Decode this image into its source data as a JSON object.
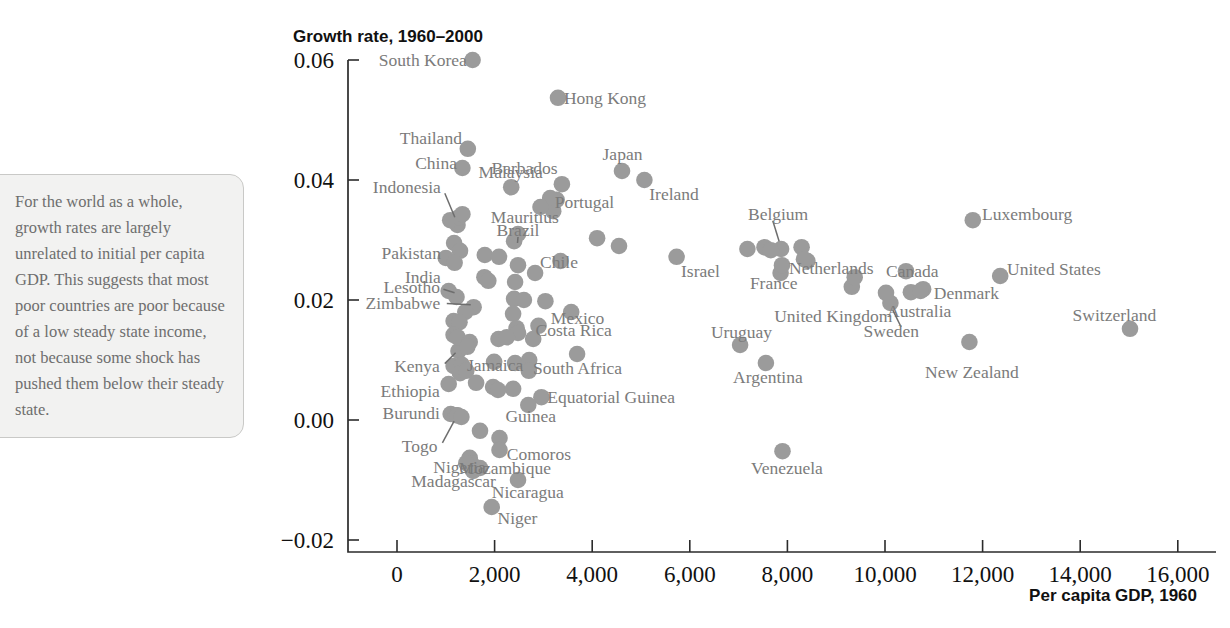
{
  "annotation": {
    "text": "For the world as a whole, growth rates are largely unrelated to initial per capita GDP. This suggests that most poor countries are poor because of a low steady state income, not because some shock has pushed them below their steady state."
  },
  "chart_data": {
    "type": "scatter",
    "title": "Growth rate, 1960–2000",
    "xlabel": "Per capita GDP, 1960",
    "ylabel": "Growth rate, 1960–2000",
    "xlim": [
      -800,
      16400
    ],
    "ylim": [
      -0.02,
      0.06
    ],
    "grid": false,
    "legend": null,
    "xticks": [
      0,
      2000,
      4000,
      6000,
      8000,
      10000,
      12000,
      14000,
      16000
    ],
    "xticklabels": [
      "0",
      "2,000",
      "4,000",
      "6,000",
      "8,000",
      "10,000",
      "12,000",
      "14,000",
      "16,000"
    ],
    "yticks": [
      -0.02,
      0.0,
      0.02,
      0.04,
      0.06
    ],
    "yticklabels": [
      "−0.02",
      "0.00",
      "0.02",
      "0.04",
      "0.06"
    ],
    "marker_color": "#9b9b9b",
    "points": [
      {
        "name": "South Korea",
        "x": 1550,
        "y": 0.06,
        "lx": 1430,
        "ly": 0.06,
        "anchor": "end"
      },
      {
        "name": "Hong Kong",
        "x": 3300,
        "y": 0.0537,
        "lx": 3420,
        "ly": 0.0537,
        "anchor": "start"
      },
      {
        "name": "Thailand",
        "x": 1450,
        "y": 0.0452,
        "lx": 1330,
        "ly": 0.047,
        "anchor": "end"
      },
      {
        "name": "China",
        "x": 1340,
        "y": 0.042,
        "lx": 1230,
        "ly": 0.0428,
        "anchor": "end"
      },
      {
        "name": "Malaysia",
        "x": 2340,
        "y": 0.0388,
        "lx": 2330,
        "ly": 0.0413,
        "anchor": "mid"
      },
      {
        "name": "Barbados",
        "x": 3380,
        "y": 0.0393,
        "lx": 3290,
        "ly": 0.042,
        "anchor": "end"
      },
      {
        "name": "Japan",
        "x": 4610,
        "y": 0.0415,
        "lx": 4620,
        "ly": 0.0443,
        "anchor": "mid"
      },
      {
        "name": "Ireland",
        "x": 5070,
        "y": 0.04,
        "lx": 5170,
        "ly": 0.0377,
        "anchor": "start"
      },
      {
        "name": "Indonesia",
        "x": 1240,
        "y": 0.0325,
        "lx": 900,
        "ly": 0.0388,
        "anchor": "end",
        "leader": [
          1185,
          0.0338,
          980,
          0.0378
        ]
      },
      {
        "name": "Portugal",
        "x": 3270,
        "y": 0.0367,
        "lx": 3840,
        "ly": 0.0363,
        "anchor": "mid"
      },
      {
        "name": "Mauritius",
        "x": 3200,
        "y": 0.0348,
        "lx": 2620,
        "ly": 0.0338,
        "anchor": "mid"
      },
      {
        "name": "Brazil",
        "x": 2480,
        "y": 0.031,
        "lx": 2480,
        "ly": 0.0317,
        "anchor": "mid",
        "leader": [
          2470,
          0.0295,
          2480,
          0.0305
        ]
      },
      {
        "name": "Belgium",
        "x": 7870,
        "y": 0.0285,
        "lx": 7810,
        "ly": 0.0343,
        "anchor": "mid",
        "leader": [
          7830,
          0.0298,
          7700,
          0.0332
        ]
      },
      {
        "name": "Luxembourg",
        "x": 11800,
        "y": 0.0333,
        "lx": 11990,
        "ly": 0.0343,
        "anchor": "start"
      },
      {
        "name": "Pakistan",
        "x": 1000,
        "y": 0.027,
        "lx": 900,
        "ly": 0.0278,
        "anchor": "end"
      },
      {
        "name": "Chile",
        "x": 3350,
        "y": 0.0265,
        "lx": 3320,
        "ly": 0.0263,
        "anchor": "mid"
      },
      {
        "name": "Israel",
        "x": 5730,
        "y": 0.0272,
        "lx": 5820,
        "ly": 0.0249,
        "anchor": "start"
      },
      {
        "name": "Netherlands",
        "x": 8410,
        "y": 0.0265,
        "lx": 8900,
        "ly": 0.0253,
        "anchor": "mid"
      },
      {
        "name": "Canada",
        "x": 10430,
        "y": 0.0248,
        "lx": 10560,
        "ly": 0.0248,
        "anchor": "mid"
      },
      {
        "name": "United States",
        "x": 12360,
        "y": 0.024,
        "lx": 12500,
        "ly": 0.0252,
        "anchor": "start"
      },
      {
        "name": "India",
        "x": 1060,
        "y": 0.0215,
        "lx": 900,
        "ly": 0.0238,
        "anchor": "end"
      },
      {
        "name": "France",
        "x": 7860,
        "y": 0.0245,
        "lx": 7720,
        "ly": 0.0228,
        "anchor": "mid"
      },
      {
        "name": "Lesotho",
        "x": 1220,
        "y": 0.0205,
        "lx": 880,
        "ly": 0.0222,
        "anchor": "end",
        "leader": [
          1180,
          0.0212,
          950,
          0.0218
        ]
      },
      {
        "name": "Denmark",
        "x": 10780,
        "y": 0.0218,
        "lx": 11000,
        "ly": 0.0211,
        "anchor": "start"
      },
      {
        "name": "Zimbabwe",
        "x": 1570,
        "y": 0.0188,
        "lx": 890,
        "ly": 0.0195,
        "anchor": "end",
        "leader": [
          1510,
          0.0192,
          1020,
          0.0194
        ]
      },
      {
        "name": "Mexico",
        "x": 3570,
        "y": 0.018,
        "lx": 3700,
        "ly": 0.017,
        "anchor": "mid"
      },
      {
        "name": "United Kingdom",
        "x": 9320,
        "y": 0.0222,
        "lx": 8940,
        "ly": 0.0173,
        "anchor": "mid"
      },
      {
        "name": "Australia",
        "x": 10530,
        "y": 0.0213,
        "lx": 10700,
        "ly": 0.0182,
        "anchor": "mid"
      },
      {
        "name": "Switzerland",
        "x": 15020,
        "y": 0.0152,
        "lx": 14700,
        "ly": 0.0175,
        "anchor": "mid"
      },
      {
        "name": "Costa Rica",
        "x": 2900,
        "y": 0.0157,
        "lx": 3620,
        "ly": 0.015,
        "anchor": "mid"
      },
      {
        "name": "Uruguay",
        "x": 7030,
        "y": 0.0125,
        "lx": 7060,
        "ly": 0.0147,
        "anchor": "mid"
      },
      {
        "name": "Sweden",
        "x": 10110,
        "y": 0.0195,
        "lx": 10130,
        "ly": 0.0148,
        "anchor": "mid",
        "leader": [
          10160,
          0.0183,
          10330,
          0.0155
        ]
      },
      {
        "name": "Kenya",
        "x": 1260,
        "y": 0.0115,
        "lx": 880,
        "ly": 0.009,
        "anchor": "end",
        "leader": [
          1200,
          0.0112,
          980,
          0.0094
        ]
      },
      {
        "name": "Jamaica",
        "x": 1990,
        "y": 0.0097,
        "lx": 2010,
        "ly": 0.0092,
        "anchor": "mid"
      },
      {
        "name": "South Africa",
        "x": 3690,
        "y": 0.011,
        "lx": 3700,
        "ly": 0.0086,
        "anchor": "mid"
      },
      {
        "name": "Argentina",
        "x": 7560,
        "y": 0.0095,
        "lx": 7600,
        "ly": 0.0072,
        "anchor": "mid"
      },
      {
        "name": "New Zealand",
        "x": 11730,
        "y": 0.013,
        "lx": 11780,
        "ly": 0.008,
        "anchor": "mid"
      },
      {
        "name": "Ethiopia",
        "x": 1060,
        "y": 0.006,
        "lx": 880,
        "ly": 0.0048,
        "anchor": "end"
      },
      {
        "name": "Equatorial Guinea",
        "x": 2960,
        "y": 0.0038,
        "lx": 3080,
        "ly": 0.0038,
        "anchor": "start"
      },
      {
        "name": "Burundi",
        "x": 1100,
        "y": 0.001,
        "lx": 880,
        "ly": 0.0012,
        "anchor": "end"
      },
      {
        "name": "Guinea",
        "x": 2690,
        "y": 0.0025,
        "lx": 2740,
        "ly": 0.0006,
        "anchor": "mid"
      },
      {
        "name": "Togo",
        "x": 1210,
        "y": 0.0008,
        "lx": 830,
        "ly": -0.0043,
        "anchor": "end",
        "leader": [
          1170,
          -0.0002,
          930,
          -0.0038
        ]
      },
      {
        "name": "Comoros",
        "x": 2100,
        "y": -0.003,
        "lx": 2250,
        "ly": -0.0057,
        "anchor": "start"
      },
      {
        "name": "Nigeria",
        "x": 1490,
        "y": -0.0063,
        "lx": 1280,
        "ly": -0.0078,
        "anchor": "mid"
      },
      {
        "name": "Mozambique",
        "x": 1700,
        "y": -0.008,
        "lx": 2210,
        "ly": -0.008,
        "anchor": "mid"
      },
      {
        "name": "Madagascar",
        "x": 1530,
        "y": -0.0073,
        "lx": 1160,
        "ly": -0.0102,
        "anchor": "mid"
      },
      {
        "name": "Nicaragua",
        "x": 2480,
        "y": -0.01,
        "lx": 2680,
        "ly": -0.012,
        "anchor": "mid"
      },
      {
        "name": "Niger",
        "x": 1940,
        "y": -0.0145,
        "lx": 2060,
        "ly": -0.0163,
        "anchor": "start"
      },
      {
        "name": "Venezuela",
        "x": 7900,
        "y": -0.0052,
        "lx": 7990,
        "ly": -0.008,
        "anchor": "mid"
      },
      {
        "name": "",
        "x": 1090,
        "y": 0.0333
      },
      {
        "name": "",
        "x": 1270,
        "y": 0.0338
      },
      {
        "name": "",
        "x": 1340,
        "y": 0.0343
      },
      {
        "name": "",
        "x": 2400,
        "y": 0.0298
      },
      {
        "name": "",
        "x": 3140,
        "y": 0.037
      },
      {
        "name": "",
        "x": 2940,
        "y": 0.0355
      },
      {
        "name": "",
        "x": 4100,
        "y": 0.0303
      },
      {
        "name": "",
        "x": 4550,
        "y": 0.029
      },
      {
        "name": "",
        "x": 1170,
        "y": 0.0295
      },
      {
        "name": "",
        "x": 1290,
        "y": 0.0282
      },
      {
        "name": "",
        "x": 1180,
        "y": 0.0262
      },
      {
        "name": "",
        "x": 1800,
        "y": 0.0275
      },
      {
        "name": "",
        "x": 2090,
        "y": 0.0272
      },
      {
        "name": "",
        "x": 2480,
        "y": 0.0258
      },
      {
        "name": "",
        "x": 2830,
        "y": 0.0245
      },
      {
        "name": "",
        "x": 1790,
        "y": 0.0238
      },
      {
        "name": "",
        "x": 1870,
        "y": 0.0232
      },
      {
        "name": "",
        "x": 2420,
        "y": 0.023
      },
      {
        "name": "",
        "x": 2400,
        "y": 0.0202
      },
      {
        "name": "",
        "x": 2600,
        "y": 0.02
      },
      {
        "name": "",
        "x": 3040,
        "y": 0.0198
      },
      {
        "name": "",
        "x": 7180,
        "y": 0.0285
      },
      {
        "name": "",
        "x": 7530,
        "y": 0.0288
      },
      {
        "name": "",
        "x": 7660,
        "y": 0.0283
      },
      {
        "name": "",
        "x": 8290,
        "y": 0.0288
      },
      {
        "name": "",
        "x": 8340,
        "y": 0.0268
      },
      {
        "name": "",
        "x": 7890,
        "y": 0.0258
      },
      {
        "name": "",
        "x": 9380,
        "y": 0.0238
      },
      {
        "name": "",
        "x": 10020,
        "y": 0.0212
      },
      {
        "name": "",
        "x": 10730,
        "y": 0.0215
      },
      {
        "name": "",
        "x": 1400,
        "y": 0.018
      },
      {
        "name": "",
        "x": 1160,
        "y": 0.0165
      },
      {
        "name": "",
        "x": 1280,
        "y": 0.0163
      },
      {
        "name": "",
        "x": 2380,
        "y": 0.0177
      },
      {
        "name": "",
        "x": 2450,
        "y": 0.0153
      },
      {
        "name": "",
        "x": 2480,
        "y": 0.0145
      },
      {
        "name": "",
        "x": 1160,
        "y": 0.0142
      },
      {
        "name": "",
        "x": 1240,
        "y": 0.0138
      },
      {
        "name": "",
        "x": 1490,
        "y": 0.013
      },
      {
        "name": "",
        "x": 1440,
        "y": 0.0122
      },
      {
        "name": "",
        "x": 2080,
        "y": 0.0135
      },
      {
        "name": "",
        "x": 2250,
        "y": 0.0138
      },
      {
        "name": "",
        "x": 2790,
        "y": 0.0135
      },
      {
        "name": "",
        "x": 1160,
        "y": 0.009
      },
      {
        "name": "",
        "x": 1330,
        "y": 0.0092
      },
      {
        "name": "",
        "x": 1290,
        "y": 0.0078
      },
      {
        "name": "",
        "x": 1420,
        "y": 0.0082
      },
      {
        "name": "",
        "x": 1620,
        "y": 0.0062
      },
      {
        "name": "",
        "x": 2420,
        "y": 0.0095
      },
      {
        "name": "",
        "x": 2710,
        "y": 0.01
      },
      {
        "name": "",
        "x": 2700,
        "y": 0.0082
      },
      {
        "name": "",
        "x": 1970,
        "y": 0.0055
      },
      {
        "name": "",
        "x": 2070,
        "y": 0.005
      },
      {
        "name": "",
        "x": 2380,
        "y": 0.0052
      },
      {
        "name": "",
        "x": 1240,
        "y": 0.0008
      },
      {
        "name": "",
        "x": 1320,
        "y": 0.0005
      },
      {
        "name": "",
        "x": 1700,
        "y": -0.0018
      },
      {
        "name": "",
        "x": 2100,
        "y": -0.005
      },
      {
        "name": "",
        "x": 1560,
        "y": -0.0085
      },
      {
        "name": "",
        "x": 1420,
        "y": -0.0072
      }
    ]
  }
}
